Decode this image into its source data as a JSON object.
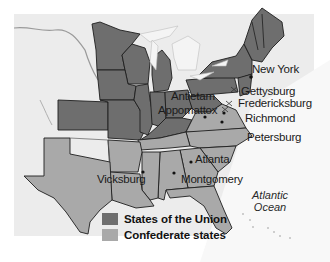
{
  "map": {
    "colors": {
      "union": "#6e6e6e",
      "confederate": "#a9a9a9",
      "land_other": "#ececec",
      "water": "#f7f7f7",
      "border": "#1e1e1e",
      "river": "#9a9a9a"
    },
    "labels": {
      "new_york": "New York",
      "gettysburg": "Gettysburg",
      "fredericksburg": "Fredericksburg",
      "antietam": "Antietam",
      "appomattox": "Appomattox",
      "richmond": "Richmond",
      "petersburg": "Petersburg",
      "atlanta": "Atlanta",
      "montgomery": "Montgomery",
      "vicksburg": "Vicksburg"
    },
    "ocean": {
      "line1": "Atlantic",
      "line2": "Ocean"
    },
    "legend": {
      "items": [
        {
          "label": "States of the Union",
          "color": "#6e6e6e"
        },
        {
          "label": "Confederate states",
          "color": "#a9a9a9"
        }
      ]
    }
  }
}
